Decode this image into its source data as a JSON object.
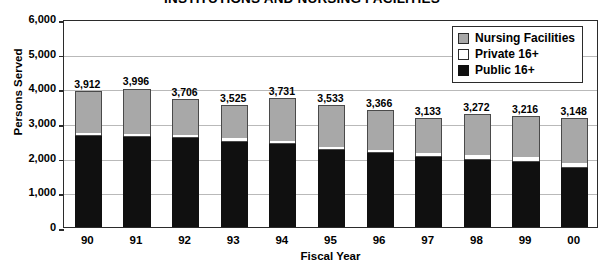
{
  "chart_data": {
    "type": "bar",
    "subtype": "stacked",
    "title": "INSTITUTIONS AND NURSING FACILITIES",
    "xlabel": "Fiscal Year",
    "ylabel": "Persons Served",
    "ylim": [
      0,
      6000
    ],
    "ytick_labels": [
      "6,000",
      "5,000",
      "4,000",
      "3,000",
      "2,000",
      "1,000",
      "0"
    ],
    "ytick_values": [
      6000,
      5000,
      4000,
      3000,
      2000,
      1000,
      0
    ],
    "grid": true,
    "legend_position": "top-right",
    "categories": [
      "90",
      "91",
      "92",
      "93",
      "94",
      "95",
      "96",
      "97",
      "98",
      "99",
      "00"
    ],
    "series": [
      {
        "name": "Public 16+",
        "color": "#101010",
        "values": [
          2640,
          2620,
          2590,
          2490,
          2410,
          2240,
          2155,
          2060,
          1975,
          1900,
          1735
        ]
      },
      {
        "name": "Private 16+",
        "color": "#ffffff",
        "values": [
          72,
          75,
          70,
          75,
          80,
          78,
          81,
          88,
          97,
          106,
          113
        ]
      },
      {
        "name": "Nursing Facilities",
        "color": "#a8a8a8",
        "values": [
          1200,
          1301,
          1046,
          960,
          1241,
          1215,
          1130,
          985,
          1200,
          1210,
          1300
        ]
      }
    ],
    "totals": [
      3912,
      3996,
      3706,
      3525,
      3731,
      3533,
      3366,
      3133,
      3272,
      3216,
      3148
    ],
    "total_labels": [
      "3,912",
      "3,996",
      "3,706",
      "3,525",
      "3,731",
      "3,533",
      "3,366",
      "3,133",
      "3,272",
      "3,216",
      "3,148"
    ],
    "legend_entries": [
      {
        "label": "Nursing Facilities",
        "swatch": "gray"
      },
      {
        "label": "Private 16+",
        "swatch": "white"
      },
      {
        "label": "Public 16+",
        "swatch": "black"
      }
    ]
  }
}
